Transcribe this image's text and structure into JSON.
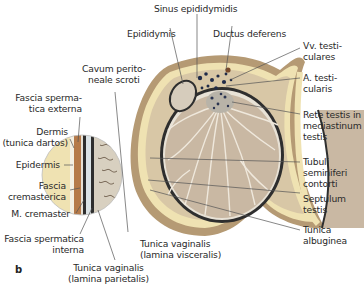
{
  "figure": {
    "panel_label": "b",
    "labels": {
      "sinus_epididymidis": "Sinus epididymidis",
      "epididymis": "Epididymis",
      "ductus_deferens": "Ductus deferens",
      "vv_testiculares": "Vv. testi-\nculares",
      "a_testicularis": "A. testi-\ncularis",
      "rete_testis": "Rete testis in\nmediastinum\ntestis",
      "tubuli_seminiferi": "Tubuli\nseminiferi\ncontorti",
      "septulum_testis": "Septulum\ntestis",
      "tunica_albuginea": "Tunica\nalbuginea",
      "cavum_peritoneale": "Cavum perito-\nneale scroti",
      "fascia_spermatica_externa": "Fascia sperma-\ntica externa",
      "dermis": "Dermis\n(tunica dartos)",
      "epidermis": "Epidermis",
      "fascia_cremasterica": "Fascia\ncremasterica",
      "m_cremaster": "M. cremaster",
      "fascia_spermatica_interna": "Fascia spermatica\ninterna",
      "tunica_vaginalis_visceralis": "Tunica vaginalis\n(lamina visceralis)",
      "tunica_vaginalis_parietalis": "Tunica vaginalis\n(lamina parietalis)"
    },
    "colors": {
      "testis_parenchyma": "#c9b8a3",
      "septa": "#efe8dc",
      "albuginea": "#3a3a3a",
      "scrotal_wall": "#b59a74",
      "skin_yellow": "#efe2b2",
      "leader_line": "#555555"
    }
  }
}
